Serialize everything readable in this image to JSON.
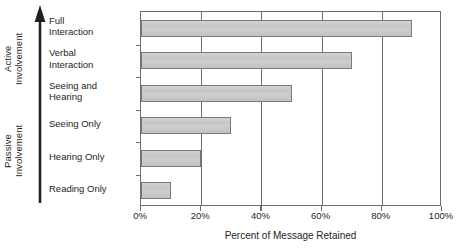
{
  "chart_data": {
    "type": "bar",
    "orientation": "horizontal",
    "title": "",
    "subtitle": "",
    "xlabel": "Percent of Message Retained",
    "ylabel": "",
    "categories": [
      "Full\nInteraction",
      "Verbal\nInteraction",
      "Seeing and\nHearing",
      "Seeing Only",
      "Hearing Only",
      "Reading Only"
    ],
    "values": [
      90,
      70,
      50,
      30,
      20,
      10
    ],
    "xlim": [
      0,
      100
    ],
    "xticks": [
      0,
      20,
      40,
      60,
      80,
      100
    ],
    "xtick_labels": [
      "0%",
      "20%",
      "40%",
      "60%",
      "80%",
      "100%"
    ],
    "grid": true,
    "grid_axis": "x",
    "legend": false,
    "bar_fill": "#c9c9c9",
    "bar_edge": "#7a7a7a",
    "axis_color": "#6d6e71",
    "background": "#ffffff",
    "annotations": [
      {
        "text": "Active\nInvolvement",
        "position": "left-upper",
        "rotation": 90
      },
      {
        "text": "Passive\nInvolvement",
        "position": "left-lower",
        "rotation": 90
      },
      {
        "text": "upward arrow spanning full category axis",
        "position": "left",
        "rotation": 90
      }
    ]
  },
  "axis": {
    "involvement": {
      "active_label": "Active\nInvolvement",
      "passive_label": "Passive\nInvolvement",
      "arrow_direction": "up"
    }
  }
}
